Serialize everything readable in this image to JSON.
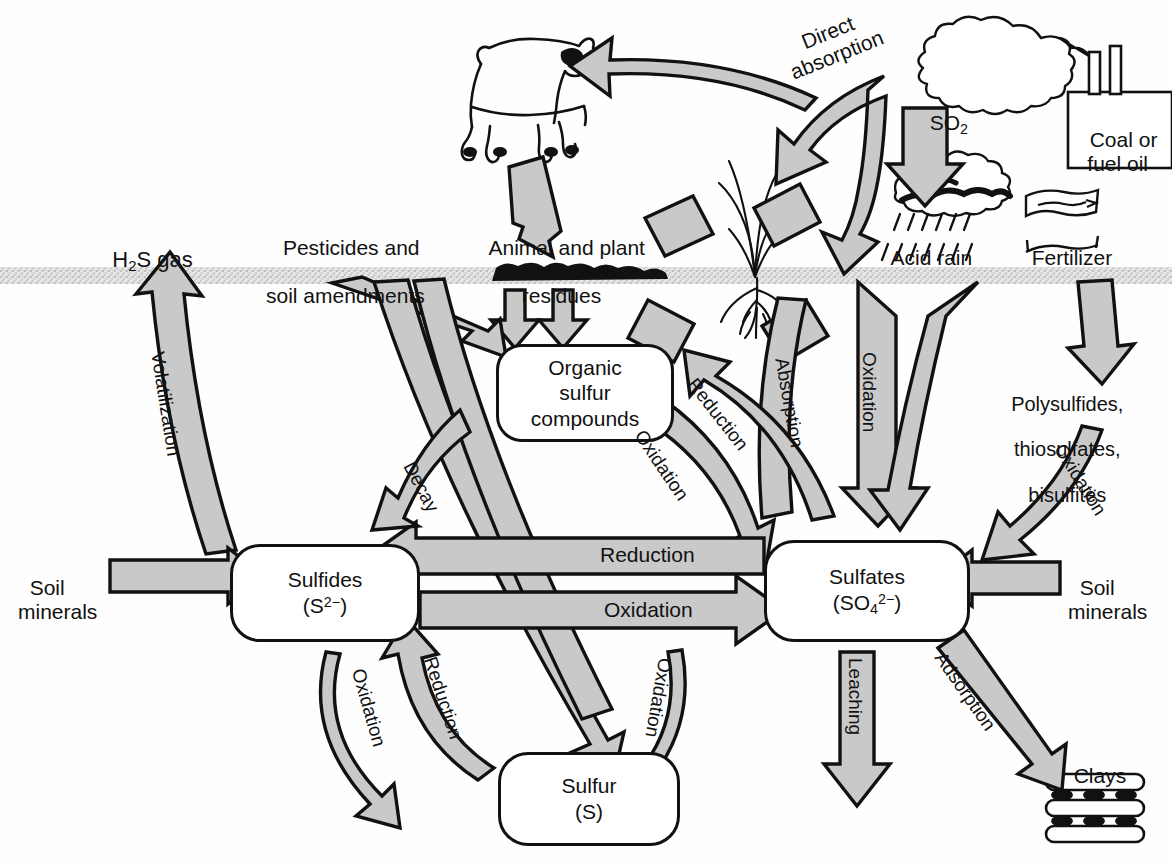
{
  "diagram": {
    "type": "cycle-diagram",
    "soil_line_label": "soil surface line",
    "colors": {
      "arrow_fill": "#c9c9c9",
      "arrow_stroke": "#000000",
      "text": "#111111",
      "soil_band": "#bdbdbd",
      "background": "#ffffff"
    }
  },
  "pools": [
    {
      "id": "organic",
      "name": "Organic sulfur compounds",
      "line1": "Organic",
      "line2": "sulfur",
      "line3": "compounds"
    },
    {
      "id": "sulfides",
      "name": "Sulfides",
      "line1": "Sulfides",
      "formula_base": "(S",
      "formula_sup": "2−",
      "formula_close": ")"
    },
    {
      "id": "sulfates",
      "name": "Sulfates",
      "line1": "Sulfates",
      "formula_base": "(SO",
      "formula_sub": "4",
      "formula_sup": "2−",
      "formula_close": ")"
    },
    {
      "id": "sulfur",
      "name": "Sulfur",
      "line1": "Sulfur",
      "formula": "(S)"
    }
  ],
  "external_labels": [
    {
      "id": "h2s",
      "text_a": "H",
      "text_sub": "2",
      "text_b": "S gas"
    },
    {
      "id": "pesticides",
      "line1": "Pesticides and",
      "line2": "soil amendments"
    },
    {
      "id": "residues",
      "line1": "Animal and plant",
      "line2": "residues"
    },
    {
      "id": "direct-absorption",
      "line1": "Direct",
      "line2": "absorption"
    },
    {
      "id": "so2",
      "text_a": "SO",
      "text_sub": "2"
    },
    {
      "id": "coal",
      "line1": "Coal or",
      "line2": "fuel oil"
    },
    {
      "id": "acid-rain",
      "text": "Acid rain"
    },
    {
      "id": "fertilizer",
      "text": "Fertilizer"
    },
    {
      "id": "polysulfides",
      "line1": "Polysulfides,",
      "line2": "thiosulfates,",
      "line3": "bisulfites"
    },
    {
      "id": "soil-minerals-left",
      "line1": "Soil",
      "line2": "minerals"
    },
    {
      "id": "soil-minerals-right",
      "line1": "Soil",
      "line2": "minerals"
    },
    {
      "id": "clays",
      "text": "Clays"
    }
  ],
  "process_arrows": [
    {
      "id": "volatilization",
      "label": "Volatilization",
      "from": "sulfides",
      "to": "h2s"
    },
    {
      "id": "decay",
      "label": "Decay",
      "from": "organic",
      "to": "sulfides"
    },
    {
      "id": "reduction-organic",
      "label": "Reduction",
      "from": "sulfates",
      "to": "organic"
    },
    {
      "id": "oxidation-organic",
      "label": "Oxidation",
      "from": "organic",
      "to": "sulfates"
    },
    {
      "id": "absorption",
      "label": "Absorption",
      "from": "sulfates",
      "to": "plant"
    },
    {
      "id": "oxidation-atm",
      "label": "Oxidation",
      "from": "acid-rain",
      "to": "sulfates"
    },
    {
      "id": "oxidation-poly",
      "label": "Oxidation",
      "from": "polysulfides",
      "to": "sulfates"
    },
    {
      "id": "reduction-mid",
      "label": "Reduction",
      "from": "sulfates",
      "to": "sulfides"
    },
    {
      "id": "oxidation-mid",
      "label": "Oxidation",
      "from": "sulfides",
      "to": "sulfates"
    },
    {
      "id": "oxidation-lower-left",
      "label": "Oxidation",
      "from": "sulfides",
      "to": "sulfur"
    },
    {
      "id": "reduction-lower-left",
      "label": "Reduction",
      "from": "sulfur",
      "to": "sulfides"
    },
    {
      "id": "oxidation-lower-right",
      "label": "Oxidation",
      "from": "sulfur",
      "to": "sulfates"
    },
    {
      "id": "leaching",
      "label": "Leaching",
      "from": "sulfates",
      "to": "below"
    },
    {
      "id": "adsorption",
      "label": "Adsorption",
      "from": "sulfates",
      "to": "clays"
    }
  ],
  "pictograms": [
    {
      "id": "cow",
      "name": "cow-illustration"
    },
    {
      "id": "plant",
      "name": "plant-with-roots-illustration"
    },
    {
      "id": "smokestack",
      "name": "smokestack-plume-illustration"
    },
    {
      "id": "raincloud",
      "name": "acid-rain-cloud-illustration"
    },
    {
      "id": "fertilizer-bag",
      "name": "fertilizer-bag-illustration"
    },
    {
      "id": "clay-stack",
      "name": "clay-layers-illustration"
    }
  ]
}
